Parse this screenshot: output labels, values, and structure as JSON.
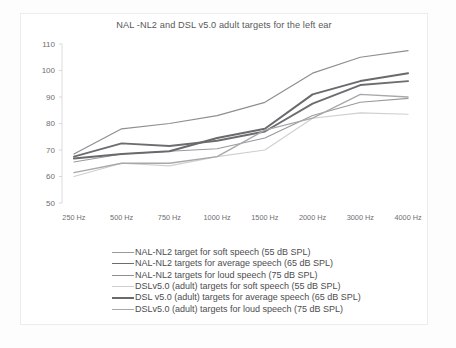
{
  "chart_data": {
    "type": "line",
    "title": "NAL -NL2 and DSL v5.0 adult targets for the left ear",
    "xlabel": "",
    "ylabel": "",
    "categories": [
      "250 Hz",
      "500 Hz",
      "750 Hz",
      "1000 Hz",
      "1500 Hz",
      "2000 Hz",
      "3000 Hz",
      "4000 Hz"
    ],
    "ylim": [
      50,
      110
    ],
    "yticks": [
      50,
      60,
      70,
      80,
      90,
      100,
      110
    ],
    "grid": false,
    "legend_position": "bottom",
    "series": [
      {
        "name": "NAL-NL2 target for soft speech (55 dB SPL)",
        "color": "#9a9a9c",
        "width": 1.1,
        "values": [
          65.5,
          68.5,
          69.5,
          70.5,
          74.5,
          83.0,
          88.0,
          89.5
        ]
      },
      {
        "name": "NAL-NL2 targets for average speech (65 dB SPL)",
        "color": "#6d6d70",
        "width": 1.9,
        "values": [
          67.5,
          72.5,
          71.5,
          73.5,
          77.0,
          87.5,
          94.5,
          96.0
        ]
      },
      {
        "name": "NAL-NL2 targets for loud speech (75 dB SPL)",
        "color": "#8f8f92",
        "width": 1.2,
        "values": [
          68.5,
          78.0,
          80.0,
          83.0,
          88.0,
          99.0,
          105.0,
          107.5
        ]
      },
      {
        "name": "DSLv5.0 (adult) targets for soft speech (55 dB SPL)",
        "color": "#cfcfd1",
        "width": 1.1,
        "values": [
          60.0,
          65.0,
          64.0,
          67.5,
          70.0,
          82.0,
          84.0,
          83.5
        ]
      },
      {
        "name": "DSL v5.0 (adult) targets for average speech (65 dB SPL)",
        "color": "#6a6a6d",
        "width": 2.0,
        "values": [
          66.8,
          68.5,
          69.5,
          74.5,
          78.0,
          91.0,
          96.0,
          99.0
        ]
      },
      {
        "name": "DSLv5.0 (adult) targets for loud speech (75 dB SPL)",
        "color": "#a8a8ab",
        "width": 1.3,
        "values": [
          61.5,
          65.0,
          65.0,
          67.5,
          77.5,
          82.0,
          91.0,
          90.0
        ]
      }
    ]
  }
}
